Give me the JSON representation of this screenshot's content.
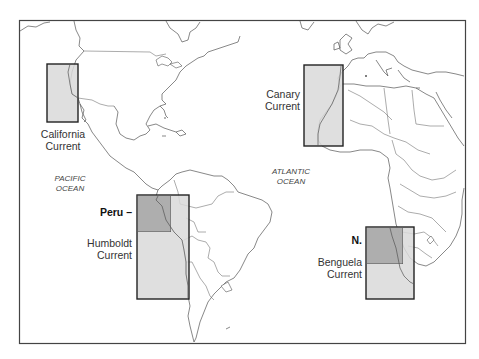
{
  "map": {
    "title": "Eastern boundary upwelling currents",
    "colors": {
      "region_fill": "#d9d9d9",
      "subregion_fill": "#a6a6a6",
      "outline": "#222222",
      "coastline": "#555555"
    },
    "regions": [
      {
        "id": "california",
        "label_line1": "California",
        "label_line2": "Current"
      },
      {
        "id": "canary",
        "label_line1": "Canary",
        "label_line2": "Current"
      },
      {
        "id": "humboldt",
        "label_line1": "Humboldt",
        "label_line2": "Current",
        "sub_label": "Peru –"
      },
      {
        "id": "benguela",
        "label_line1": "Benguela",
        "label_line2": "Current",
        "sub_label": "N."
      }
    ],
    "oceans": [
      {
        "id": "pacific",
        "line1": "PACIFIC",
        "line2": "OCEAN"
      },
      {
        "id": "atlantic",
        "line1": "ATLANTIC",
        "line2": "OCEAN"
      }
    ]
  }
}
